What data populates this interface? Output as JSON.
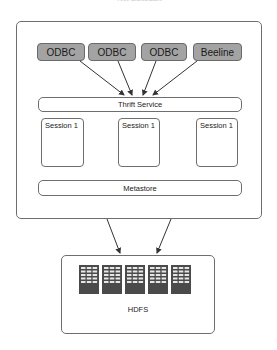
{
  "diagram": {
    "caption_top": "Hive architecture",
    "clients": [
      {
        "label": "ODBC",
        "x": 37,
        "w": 48
      },
      {
        "label": "ODBC",
        "x": 88,
        "w": 48
      },
      {
        "label": "ODBC",
        "x": 141,
        "w": 46
      },
      {
        "label": "Beeline",
        "x": 193,
        "w": 49
      }
    ],
    "thrift_service": {
      "label": "Thrift Service"
    },
    "sessions": [
      {
        "label": "Session 1",
        "x": 41,
        "w": 43
      },
      {
        "label": "Session 1",
        "x": 118,
        "w": 42
      },
      {
        "label": "Session 1",
        "x": 196,
        "w": 42
      }
    ],
    "metastore": {
      "label": "Metastore"
    },
    "hdfs": {
      "label": "HDFS",
      "server_count": 5,
      "server_x": [
        79,
        102,
        125,
        148,
        171
      ]
    },
    "colors": {
      "client_fill": "#a3a3a3",
      "border": "#6e6e6e",
      "arrow": "#333333",
      "server_fill": "#4a4a4a",
      "server_slot": "#e6e6e6"
    },
    "edges": [
      {
        "from": "client-odbc-1",
        "to": "thrift-service"
      },
      {
        "from": "client-odbc-2",
        "to": "thrift-service"
      },
      {
        "from": "client-odbc-3",
        "to": "thrift-service"
      },
      {
        "from": "client-beeline",
        "to": "thrift-service"
      },
      {
        "from": "hive-server",
        "to": "hdfs"
      },
      {
        "from": "hive-server",
        "to": "hdfs"
      }
    ]
  }
}
